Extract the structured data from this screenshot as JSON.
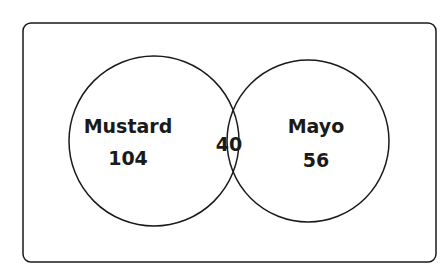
{
  "diagram": {
    "type": "venn",
    "sets": [
      {
        "label": "Mustard",
        "only_count": "104"
      },
      {
        "label": "Mayo",
        "only_count": "56"
      }
    ],
    "intersection_count": "40"
  },
  "colors": {
    "stroke": "#1a1a1a",
    "background": "#ffffff"
  }
}
